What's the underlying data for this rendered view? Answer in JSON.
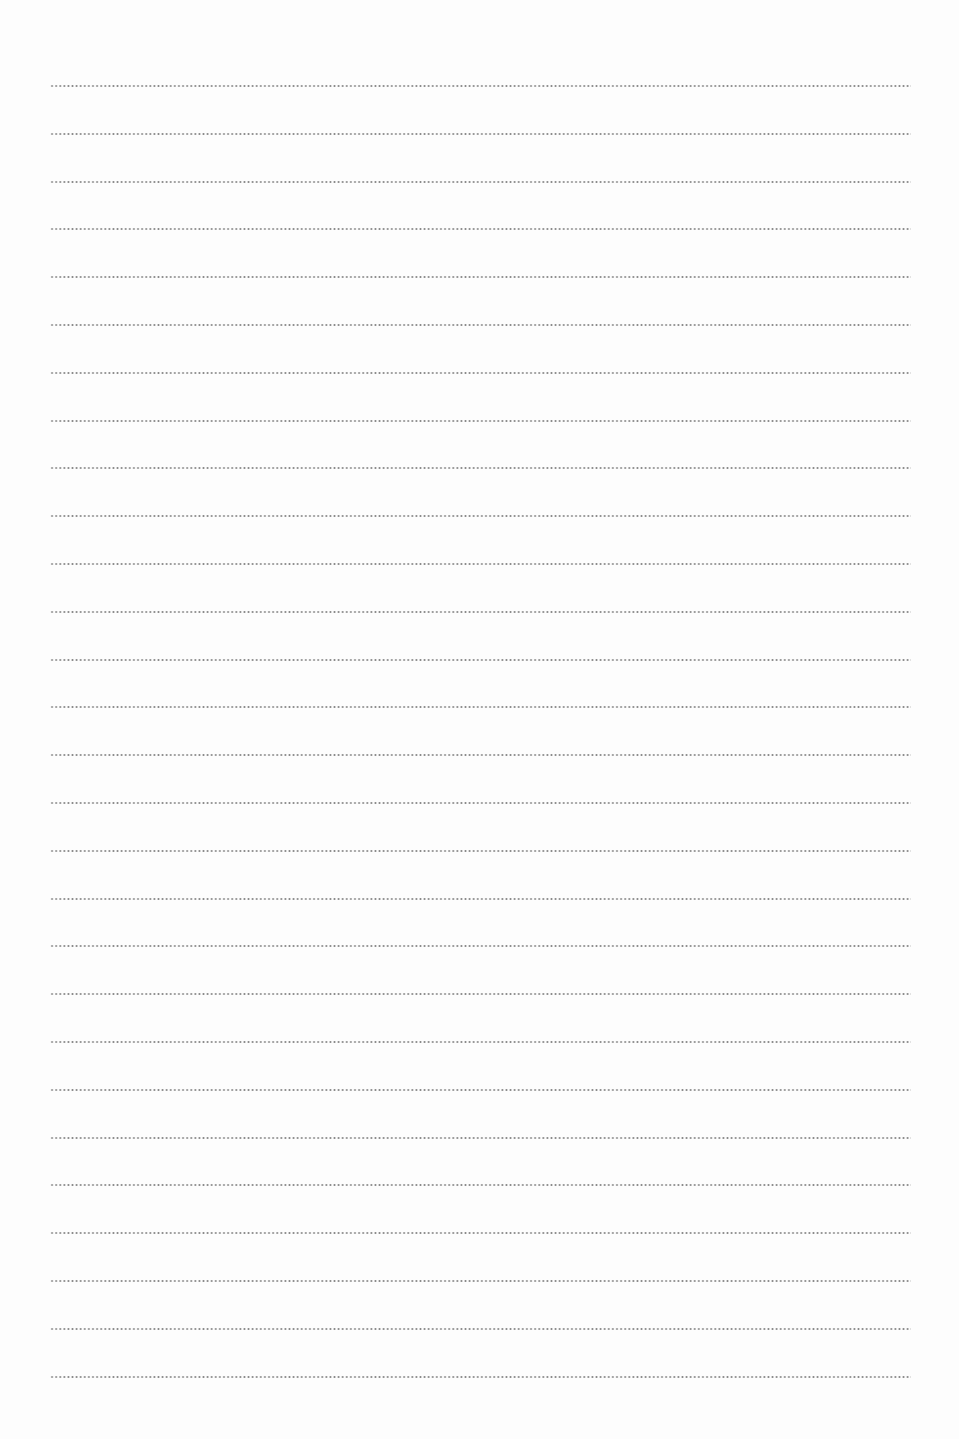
{
  "document": {
    "type": "lined-writing-sheet",
    "line_style": "dotted",
    "line_color": "#8a8a8a",
    "background_color": "#fdfdfd",
    "line_count": 28,
    "first_line_y": 85,
    "line_spacing": 47.8,
    "line_left": 50,
    "line_width": 861
  }
}
